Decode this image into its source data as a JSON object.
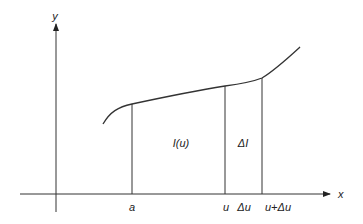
{
  "diagram": {
    "axes": {
      "x_label": "x",
      "y_label": "y"
    },
    "tick_labels": {
      "a": "a",
      "u": "u",
      "delta_u": "Δu",
      "u_plus_delta_u": "u+Δu"
    },
    "region_labels": {
      "integral": "I(u)",
      "delta_integral": "ΔI"
    },
    "colors": {
      "stroke": "#333333",
      "background": "#ffffff"
    }
  }
}
